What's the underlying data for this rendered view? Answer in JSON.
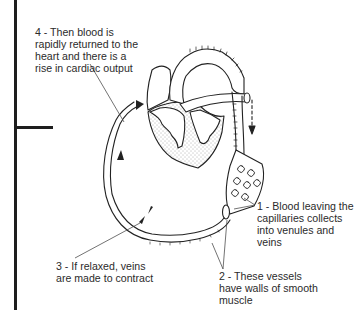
{
  "diagram": {
    "frame": {
      "bar_color": "#1e1e1e"
    },
    "labels": [
      {
        "id": "step-1",
        "lines": [
          "1 - Blood leaving the",
          "capillaries collects",
          "into venules and",
          "veins"
        ]
      },
      {
        "id": "step-2",
        "lines": [
          "2 - These vessels",
          "have walls of smooth",
          "muscle"
        ]
      },
      {
        "id": "step-3",
        "lines": [
          "3 - If relaxed, veins",
          "are made to contract"
        ]
      },
      {
        "id": "step-4",
        "lines": [
          "4 - Then blood is",
          "rapidly returned to the",
          "heart and there is a",
          "rise in cardiac output"
        ]
      }
    ],
    "parts": [
      "heart",
      "aorta",
      "capillary-bed",
      "vein",
      "blood-flow-arrows",
      "dashed-flow-arrow"
    ],
    "colors": {
      "line": "#222222",
      "text": "#2b2b2b",
      "stipple": "#555555",
      "background": "#ffffff"
    }
  }
}
